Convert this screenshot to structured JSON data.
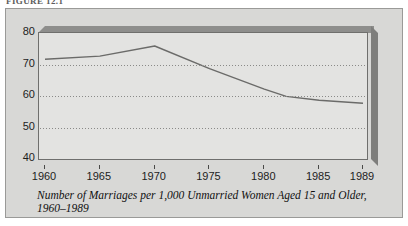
{
  "figure": {
    "label": "FIGURE 12.1",
    "caption_line1": "Number of Marriages per 1,000 Unmarried Women Aged 15 and Older,",
    "caption_line2": "1960–1989"
  },
  "colors": {
    "page_background": "#ffffff",
    "panel_background": "#d8d8d6",
    "panel_border": "#9a9a98",
    "plot_face": "#e3e3e1",
    "plot_border": "#6f6f6d",
    "plot_top_face": "#8e8e8c",
    "plot_side_face": "#7e7e7c",
    "gridline": "#8a8a88",
    "series_line": "#6b6b69",
    "axis_text": "#1d1d1d"
  },
  "chart_data": {
    "type": "line",
    "title": "",
    "xlabel": "",
    "ylabel": "",
    "xlim": [
      1960,
      1989
    ],
    "ylim": [
      40,
      80
    ],
    "grid": true,
    "gridlines_y": [
      50,
      60,
      70
    ],
    "legend": null,
    "xticks": [
      "1960",
      "1965",
      "1970",
      "1975",
      "1980",
      "1985",
      "1989"
    ],
    "xtick_values": [
      1960,
      1965,
      1970,
      1975,
      1980,
      1985,
      1989
    ],
    "yticks": [
      "40",
      "50",
      "60",
      "70",
      "80"
    ],
    "ytick_values": [
      40,
      50,
      60,
      70,
      80
    ],
    "series": [
      {
        "name": "Marriage rate",
        "x": [
          1960,
          1965,
          1970,
          1975,
          1980,
          1982,
          1985,
          1989
        ],
        "values": [
          72.0,
          73.0,
          76.2,
          69.0,
          62.5,
          60.2,
          59.0,
          58.0
        ]
      }
    ]
  }
}
